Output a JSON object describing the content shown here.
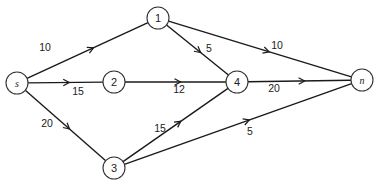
{
  "diagram": {
    "type": "directed-network-flow-graph",
    "nodes": [
      {
        "id": "s",
        "label": "s",
        "x": 17,
        "y": 83,
        "italic": true
      },
      {
        "id": "1",
        "label": "1",
        "x": 158,
        "y": 18,
        "italic": false
      },
      {
        "id": "2",
        "label": "2",
        "x": 114,
        "y": 82,
        "italic": false
      },
      {
        "id": "3",
        "label": "3",
        "x": 114,
        "y": 168,
        "italic": false
      },
      {
        "id": "4",
        "label": "4",
        "x": 237,
        "y": 82,
        "italic": false
      },
      {
        "id": "n",
        "label": "n",
        "x": 362,
        "y": 80,
        "italic": true
      }
    ],
    "edges": [
      {
        "from": "s",
        "to": "1",
        "label": "10",
        "lx": 45,
        "ly": 47
      },
      {
        "from": "s",
        "to": "2",
        "label": "15",
        "lx": 78,
        "ly": 91
      },
      {
        "from": "s",
        "to": "3",
        "label": "20",
        "lx": 47,
        "ly": 123
      },
      {
        "from": "1",
        "to": "4",
        "label": "5",
        "lx": 209,
        "ly": 48
      },
      {
        "from": "1",
        "to": "n",
        "label": "10",
        "lx": 277,
        "ly": 45
      },
      {
        "from": "2",
        "to": "4",
        "label": "12",
        "lx": 179,
        "ly": 89
      },
      {
        "from": "4",
        "to": "n",
        "label": "20",
        "lx": 274,
        "ly": 88
      },
      {
        "from": "3",
        "to": "4",
        "label": "15",
        "lx": 160,
        "ly": 128
      },
      {
        "from": "3",
        "to": "n",
        "label": "5",
        "lx": 250,
        "ly": 131
      }
    ],
    "node_radius": 11
  }
}
